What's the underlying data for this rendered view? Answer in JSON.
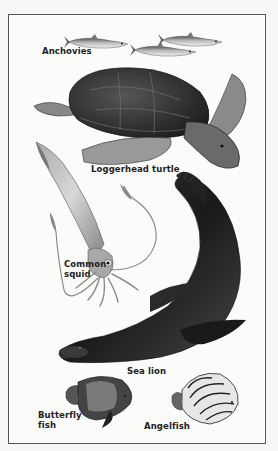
{
  "plate": {
    "labels": {
      "anchovies": "Anchovies",
      "turtle": "Loggerhead turtle",
      "squid": "Common\nsquid",
      "sea_lion": "Sea lion",
      "butterfly_fish": "Butterfly\nfish",
      "angelfish": "Angelfish"
    }
  },
  "colors": {
    "border": "#555555",
    "background": "#fbfbfa",
    "label_text": "#222222"
  }
}
